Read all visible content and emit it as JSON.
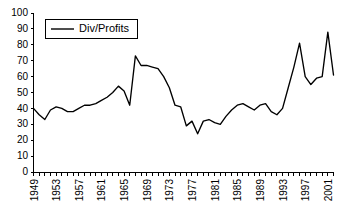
{
  "chart_data": {
    "type": "line",
    "title": "",
    "subtitle": "",
    "xlabel": "",
    "ylabel": "",
    "xlim": [
      1949,
      2002
    ],
    "ylim": [
      0,
      100
    ],
    "grid": false,
    "legend_position": "top-left",
    "y_ticks": [
      0,
      10,
      20,
      30,
      40,
      50,
      60,
      70,
      80,
      90,
      100
    ],
    "y_tick_labels": [
      "0",
      "10",
      "20",
      "30",
      "40",
      "50",
      "60",
      "70",
      "80",
      "90",
      "100"
    ],
    "x_tick_labels": [
      "1949",
      "1953",
      "1957",
      "1961",
      "1965",
      "1969",
      "1973",
      "1977",
      "1981",
      "1985",
      "1989",
      "1993",
      "1997",
      "2001"
    ],
    "x_tick_label_years": [
      1949,
      1953,
      1957,
      1961,
      1965,
      1969,
      1973,
      1977,
      1981,
      1985,
      1989,
      1993,
      1997,
      2001
    ],
    "x_minor_tick_years": [
      1949,
      1950,
      1951,
      1952,
      1953,
      1954,
      1955,
      1956,
      1957,
      1958,
      1959,
      1960,
      1961,
      1962,
      1963,
      1964,
      1965,
      1966,
      1967,
      1968,
      1969,
      1970,
      1971,
      1972,
      1973,
      1974,
      1975,
      1976,
      1977,
      1978,
      1979,
      1980,
      1981,
      1982,
      1983,
      1984,
      1985,
      1986,
      1987,
      1988,
      1989,
      1990,
      1991,
      1992,
      1993,
      1994,
      1995,
      1996,
      1997,
      1998,
      1999,
      2000,
      2001,
      2002
    ],
    "series": [
      {
        "name": "Div/Profits",
        "color": "#000000",
        "x": [
          1949,
          1950,
          1951,
          1952,
          1953,
          1954,
          1955,
          1956,
          1957,
          1958,
          1959,
          1960,
          1961,
          1962,
          1963,
          1964,
          1965,
          1966,
          1967,
          1968,
          1969,
          1970,
          1971,
          1972,
          1973,
          1974,
          1975,
          1976,
          1977,
          1978,
          1979,
          1980,
          1981,
          1982,
          1983,
          1984,
          1985,
          1986,
          1987,
          1988,
          1989,
          1990,
          1991,
          1992,
          1993,
          1994,
          1995,
          1996,
          1997,
          1998,
          1999,
          2000,
          2001,
          2002
        ],
        "values": [
          40,
          36,
          33,
          39,
          41,
          40,
          38,
          38,
          40,
          42,
          42,
          43,
          45,
          47,
          50,
          54,
          51,
          42,
          73,
          67,
          67,
          66,
          65,
          60,
          53,
          42,
          41,
          29,
          32,
          24,
          32,
          33,
          31,
          30,
          35,
          39,
          42,
          43,
          41,
          39,
          42,
          43,
          38,
          36,
          40,
          53,
          66,
          81,
          60,
          55,
          59,
          60,
          88,
          61
        ]
      }
    ],
    "annotations": []
  },
  "legend": {
    "entries": [
      {
        "label": "Div/Profits",
        "color": "#000000"
      }
    ]
  },
  "colors": {
    "line": "#000000",
    "axis": "#000000",
    "background": "#ffffff"
  }
}
